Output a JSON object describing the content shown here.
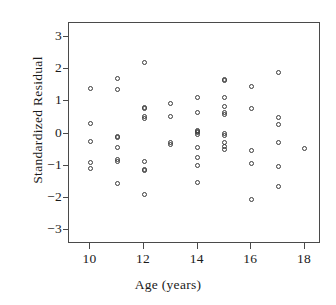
{
  "chart_data": {
    "type": "scatter",
    "title": "",
    "xlabel": "Age (years)",
    "ylabel": "Standardized Residual",
    "xlim": [
      9.2,
      18.6
    ],
    "ylim": [
      -3.45,
      3.45
    ],
    "xticks": [
      10,
      12,
      14,
      16,
      18
    ],
    "yticks": [
      3,
      2,
      1,
      0,
      -1,
      -2,
      -3
    ],
    "xtick_labels": [
      "10",
      "12",
      "14",
      "16",
      "18"
    ],
    "ytick_labels": [
      "3",
      "2",
      "1",
      "0",
      "−1",
      "−2",
      "−3"
    ],
    "grid": false,
    "legend": null,
    "marker": "open-circle",
    "marker_color": "#3a3a3a",
    "frame_color": "#4a4a4a",
    "background": "#ffffff",
    "x": [
      10,
      10,
      10,
      10,
      10,
      11,
      11,
      11,
      11,
      11,
      11,
      11,
      11,
      12,
      12,
      12,
      12,
      12,
      12,
      12,
      12,
      12,
      13,
      13,
      13,
      13,
      14,
      14,
      14,
      14,
      14,
      14,
      14,
      14,
      14,
      14,
      15,
      15,
      15,
      15,
      15,
      15,
      15,
      15,
      15,
      15,
      15,
      16,
      16,
      16,
      16,
      16,
      17,
      17,
      17,
      17,
      17,
      17,
      18
    ],
    "y": [
      1.4,
      0.31,
      -0.26,
      -0.92,
      -1.1,
      1.72,
      1.37,
      -0.1,
      -0.14,
      -0.45,
      -0.8,
      -0.87,
      -1.55,
      2.22,
      0.82,
      0.79,
      0.52,
      0.46,
      -0.86,
      -1.12,
      -1.17,
      -1.91,
      0.95,
      0.53,
      -0.29,
      -0.35,
      1.11,
      0.65,
      0.09,
      0.03,
      -0.02,
      -0.43,
      -0.76,
      -0.99,
      -1.52,
      0.05,
      1.69,
      1.66,
      1.12,
      0.83,
      0.66,
      0.6,
      0.01,
      -0.06,
      -0.27,
      -0.42,
      -0.5,
      1.47,
      0.79,
      -0.53,
      -0.95,
      -2.05,
      1.89,
      0.5,
      0.28,
      -0.29,
      -1.04,
      -1.65,
      -0.48
    ]
  }
}
